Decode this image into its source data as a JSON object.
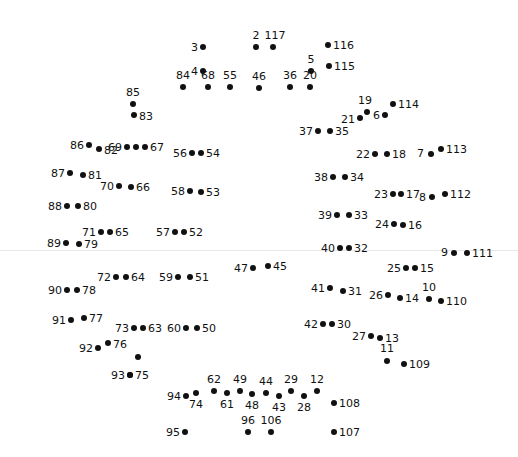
{
  "figure": {
    "kind": "connect-the-dots-puzzle",
    "title": "",
    "width": 518,
    "height": 457,
    "background_color": "#ffffff",
    "dot_color": "#111111",
    "label_color": "#111111",
    "fold_line_color": "#e8e8e8",
    "fold_line_y": 250,
    "total_points": 117
  },
  "points": [
    {
      "n": "3",
      "x": 203,
      "y": 47,
      "pos": "l",
      "lx": 198,
      "ly": 47
    },
    {
      "n": "2",
      "x": 256,
      "y": 47,
      "pos": "t",
      "lx": 256,
      "ly": 41
    },
    {
      "n": "117",
      "x": 273,
      "y": 47,
      "pos": "t",
      "lx": 275,
      "ly": 41
    },
    {
      "n": "116",
      "x": 328,
      "y": 45,
      "pos": "r",
      "lx": 333,
      "ly": 45
    },
    {
      "n": "115",
      "x": 329,
      "y": 66,
      "pos": "r",
      "lx": 334,
      "ly": 66
    },
    {
      "n": "5",
      "x": 311,
      "y": 71,
      "pos": "t",
      "lx": 311,
      "ly": 65
    },
    {
      "n": "4",
      "x": 203,
      "y": 71,
      "pos": "l",
      "lx": 198,
      "ly": 71
    },
    {
      "n": "84",
      "x": 183,
      "y": 87,
      "pos": "t",
      "lx": 183,
      "ly": 81
    },
    {
      "n": "68",
      "x": 208,
      "y": 87,
      "pos": "t",
      "lx": 208,
      "ly": 81
    },
    {
      "n": "55",
      "x": 230,
      "y": 87,
      "pos": "t",
      "lx": 230,
      "ly": 81
    },
    {
      "n": "46",
      "x": 259,
      "y": 88,
      "pos": "t",
      "lx": 259,
      "ly": 82
    },
    {
      "n": "36",
      "x": 290,
      "y": 87,
      "pos": "t",
      "lx": 290,
      "ly": 81
    },
    {
      "n": "20",
      "x": 310,
      "y": 87,
      "pos": "t",
      "lx": 310,
      "ly": 81
    },
    {
      "n": "85",
      "x": 133,
      "y": 104,
      "pos": "t",
      "lx": 133,
      "ly": 98
    },
    {
      "n": "83",
      "x": 134,
      "y": 115,
      "pos": "r",
      "lx": 139,
      "ly": 116
    },
    {
      "n": "114",
      "x": 393,
      "y": 104,
      "pos": "r",
      "lx": 398,
      "ly": 104
    },
    {
      "n": "19",
      "x": 367,
      "y": 112,
      "pos": "t",
      "lx": 365,
      "ly": 106
    },
    {
      "n": "6",
      "x": 385,
      "y": 115,
      "pos": "l",
      "lx": 380,
      "ly": 115
    },
    {
      "n": "21",
      "x": 360,
      "y": 118,
      "pos": "l",
      "lx": 355,
      "ly": 119
    },
    {
      "n": "37",
      "x": 318,
      "y": 131,
      "pos": "l",
      "lx": 313,
      "ly": 131
    },
    {
      "n": "35",
      "x": 330,
      "y": 131,
      "pos": "r",
      "lx": 335,
      "ly": 131
    },
    {
      "n": "86",
      "x": 89,
      "y": 145,
      "pos": "l",
      "lx": 84,
      "ly": 145
    },
    {
      "n": "82",
      "x": 99,
      "y": 149,
      "pos": "r",
      "lx": 104,
      "ly": 150
    },
    {
      "n": "69",
      "x": 127,
      "y": 147,
      "pos": "l",
      "lx": 122,
      "ly": 147
    },
    {
      "n": "67",
      "x": 145,
      "y": 147,
      "pos": "r",
      "lx": 150,
      "ly": 147
    },
    {
      "n": "69b",
      "x": 136,
      "y": 147,
      "pos": "none",
      "lx": 0,
      "ly": 0
    },
    {
      "n": "56",
      "x": 192,
      "y": 153,
      "pos": "l",
      "lx": 187,
      "ly": 153
    },
    {
      "n": "54",
      "x": 201,
      "y": 153,
      "pos": "r",
      "lx": 206,
      "ly": 153
    },
    {
      "n": "7",
      "x": 431,
      "y": 154,
      "pos": "l",
      "lx": 424,
      "ly": 153
    },
    {
      "n": "113",
      "x": 441,
      "y": 149,
      "pos": "r",
      "lx": 446,
      "ly": 149
    },
    {
      "n": "22",
      "x": 375,
      "y": 154,
      "pos": "l",
      "lx": 370,
      "ly": 154
    },
    {
      "n": "18",
      "x": 387,
      "y": 154,
      "pos": "r",
      "lx": 392,
      "ly": 154
    },
    {
      "n": "87",
      "x": 70,
      "y": 173,
      "pos": "l",
      "lx": 65,
      "ly": 173
    },
    {
      "n": "81",
      "x": 83,
      "y": 175,
      "pos": "r",
      "lx": 88,
      "ly": 175
    },
    {
      "n": "70",
      "x": 119,
      "y": 186,
      "pos": "l",
      "lx": 114,
      "ly": 186
    },
    {
      "n": "66",
      "x": 131,
      "y": 187,
      "pos": "r",
      "lx": 136,
      "ly": 187
    },
    {
      "n": "58",
      "x": 190,
      "y": 191,
      "pos": "l",
      "lx": 185,
      "ly": 191
    },
    {
      "n": "53",
      "x": 201,
      "y": 192,
      "pos": "r",
      "lx": 206,
      "ly": 192
    },
    {
      "n": "38",
      "x": 333,
      "y": 177,
      "pos": "l",
      "lx": 328,
      "ly": 177
    },
    {
      "n": "34",
      "x": 345,
      "y": 177,
      "pos": "r",
      "lx": 350,
      "ly": 177
    },
    {
      "n": "23",
      "x": 393,
      "y": 194,
      "pos": "l",
      "lx": 388,
      "ly": 194
    },
    {
      "n": "17",
      "x": 401,
      "y": 194,
      "pos": "r",
      "lx": 406,
      "ly": 194
    },
    {
      "n": "8",
      "x": 432,
      "y": 197,
      "pos": "l",
      "lx": 426,
      "ly": 197
    },
    {
      "n": "112",
      "x": 445,
      "y": 194,
      "pos": "r",
      "lx": 450,
      "ly": 194
    },
    {
      "n": "88",
      "x": 67,
      "y": 206,
      "pos": "l",
      "lx": 62,
      "ly": 206
    },
    {
      "n": "80",
      "x": 78,
      "y": 206,
      "pos": "r",
      "lx": 83,
      "ly": 206
    },
    {
      "n": "39",
      "x": 337,
      "y": 215,
      "pos": "l",
      "lx": 332,
      "ly": 215
    },
    {
      "n": "33",
      "x": 349,
      "y": 215,
      "pos": "r",
      "lx": 354,
      "ly": 215
    },
    {
      "n": "24",
      "x": 394,
      "y": 224,
      "pos": "l",
      "lx": 389,
      "ly": 224
    },
    {
      "n": "16",
      "x": 403,
      "y": 225,
      "pos": "r",
      "lx": 408,
      "ly": 225
    },
    {
      "n": "71",
      "x": 101,
      "y": 232,
      "pos": "l",
      "lx": 96,
      "ly": 232
    },
    {
      "n": "65",
      "x": 110,
      "y": 232,
      "pos": "r",
      "lx": 115,
      "ly": 232
    },
    {
      "n": "57",
      "x": 175,
      "y": 232,
      "pos": "l",
      "lx": 170,
      "ly": 232
    },
    {
      "n": "52",
      "x": 184,
      "y": 232,
      "pos": "r",
      "lx": 189,
      "ly": 232
    },
    {
      "n": "89",
      "x": 66,
      "y": 243,
      "pos": "l",
      "lx": 61,
      "ly": 243
    },
    {
      "n": "79",
      "x": 79,
      "y": 244,
      "pos": "r",
      "lx": 84,
      "ly": 244
    },
    {
      "n": "40",
      "x": 340,
      "y": 248,
      "pos": "l",
      "lx": 335,
      "ly": 248
    },
    {
      "n": "32",
      "x": 349,
      "y": 248,
      "pos": "r",
      "lx": 354,
      "ly": 248
    },
    {
      "n": "9",
      "x": 454,
      "y": 253,
      "pos": "l",
      "lx": 448,
      "ly": 252
    },
    {
      "n": "111",
      "x": 467,
      "y": 253,
      "pos": "r",
      "lx": 472,
      "ly": 253
    },
    {
      "n": "47",
      "x": 253,
      "y": 268,
      "pos": "l",
      "lx": 248,
      "ly": 268
    },
    {
      "n": "45",
      "x": 268,
      "y": 266,
      "pos": "r",
      "lx": 273,
      "ly": 266
    },
    {
      "n": "72",
      "x": 116,
      "y": 277,
      "pos": "l",
      "lx": 111,
      "ly": 277
    },
    {
      "n": "64",
      "x": 126,
      "y": 277,
      "pos": "r",
      "lx": 131,
      "ly": 277
    },
    {
      "n": "59",
      "x": 178,
      "y": 277,
      "pos": "l",
      "lx": 173,
      "ly": 277
    },
    {
      "n": "51",
      "x": 190,
      "y": 277,
      "pos": "r",
      "lx": 195,
      "ly": 277
    },
    {
      "n": "25",
      "x": 406,
      "y": 268,
      "pos": "l",
      "lx": 401,
      "ly": 268
    },
    {
      "n": "15",
      "x": 415,
      "y": 268,
      "pos": "r",
      "lx": 420,
      "ly": 268
    },
    {
      "n": "90",
      "x": 67,
      "y": 290,
      "pos": "l",
      "lx": 62,
      "ly": 290
    },
    {
      "n": "78",
      "x": 77,
      "y": 290,
      "pos": "r",
      "lx": 82,
      "ly": 290
    },
    {
      "n": "41",
      "x": 330,
      "y": 288,
      "pos": "l",
      "lx": 325,
      "ly": 288
    },
    {
      "n": "31",
      "x": 343,
      "y": 291,
      "pos": "r",
      "lx": 348,
      "ly": 291
    },
    {
      "n": "26",
      "x": 388,
      "y": 295,
      "pos": "l",
      "lx": 383,
      "ly": 295
    },
    {
      "n": "14",
      "x": 400,
      "y": 298,
      "pos": "r",
      "lx": 405,
      "ly": 298
    },
    {
      "n": "10",
      "x": 429,
      "y": 299,
      "pos": "t",
      "lx": 429,
      "ly": 293
    },
    {
      "n": "110",
      "x": 441,
      "y": 301,
      "pos": "r",
      "lx": 446,
      "ly": 301
    },
    {
      "n": "91",
      "x": 71,
      "y": 320,
      "pos": "l",
      "lx": 66,
      "ly": 320
    },
    {
      "n": "77",
      "x": 84,
      "y": 318,
      "pos": "r",
      "lx": 89,
      "ly": 318
    },
    {
      "n": "73",
      "x": 134,
      "y": 328,
      "pos": "l",
      "lx": 129,
      "ly": 328
    },
    {
      "n": "63",
      "x": 143,
      "y": 328,
      "pos": "r",
      "lx": 148,
      "ly": 328
    },
    {
      "n": "60",
      "x": 186,
      "y": 328,
      "pos": "l",
      "lx": 181,
      "ly": 328
    },
    {
      "n": "50",
      "x": 197,
      "y": 328,
      "pos": "r",
      "lx": 202,
      "ly": 328
    },
    {
      "n": "42",
      "x": 323,
      "y": 324,
      "pos": "l",
      "lx": 318,
      "ly": 324
    },
    {
      "n": "30",
      "x": 332,
      "y": 324,
      "pos": "r",
      "lx": 337,
      "ly": 324
    },
    {
      "n": "27",
      "x": 371,
      "y": 336,
      "pos": "l",
      "lx": 366,
      "ly": 336
    },
    {
      "n": "13",
      "x": 380,
      "y": 338,
      "pos": "r",
      "lx": 385,
      "ly": 338
    },
    {
      "n": "76",
      "x": 108,
      "y": 343,
      "pos": "r",
      "lx": 113,
      "ly": 344
    },
    {
      "n": "92",
      "x": 98,
      "y": 348,
      "pos": "l",
      "lx": 93,
      "ly": 348
    },
    {
      "n": "11",
      "x": 387,
      "y": 361,
      "pos": "t",
      "lx": 387,
      "ly": 354
    },
    {
      "n": "109",
      "x": 404,
      "y": 364,
      "pos": "r",
      "lx": 409,
      "ly": 364
    },
    {
      "n": "75",
      "x": 138,
      "y": 357,
      "pos": "none",
      "lx": 0,
      "ly": 0
    },
    {
      "n": "93",
      "x": 130,
      "y": 375,
      "pos": "l",
      "lx": 125,
      "ly": 375
    },
    {
      "n": "75b",
      "x": 130,
      "y": 375,
      "pos": "r",
      "lx": 135,
      "ly": 375
    },
    {
      "n": "94",
      "x": 186,
      "y": 396,
      "pos": "l",
      "lx": 181,
      "ly": 396
    },
    {
      "n": "74",
      "x": 196,
      "y": 393,
      "pos": "b",
      "lx": 196,
      "ly": 399
    },
    {
      "n": "62",
      "x": 214,
      "y": 391,
      "pos": "t",
      "lx": 214,
      "ly": 385
    },
    {
      "n": "61",
      "x": 227,
      "y": 393,
      "pos": "b",
      "lx": 227,
      "ly": 399
    },
    {
      "n": "49",
      "x": 240,
      "y": 391,
      "pos": "t",
      "lx": 240,
      "ly": 385
    },
    {
      "n": "48",
      "x": 252,
      "y": 394,
      "pos": "b",
      "lx": 252,
      "ly": 400
    },
    {
      "n": "44",
      "x": 266,
      "y": 393,
      "pos": "t",
      "lx": 266,
      "ly": 387
    },
    {
      "n": "43",
      "x": 279,
      "y": 396,
      "pos": "b",
      "lx": 279,
      "ly": 402
    },
    {
      "n": "29",
      "x": 291,
      "y": 391,
      "pos": "t",
      "lx": 291,
      "ly": 385
    },
    {
      "n": "28",
      "x": 304,
      "y": 396,
      "pos": "b",
      "lx": 304,
      "ly": 402
    },
    {
      "n": "12",
      "x": 317,
      "y": 391,
      "pos": "t",
      "lx": 317,
      "ly": 385
    },
    {
      "n": "108",
      "x": 334,
      "y": 403,
      "pos": "r",
      "lx": 339,
      "ly": 403
    },
    {
      "n": "95",
      "x": 185,
      "y": 432,
      "pos": "l",
      "lx": 180,
      "ly": 432
    },
    {
      "n": "96",
      "x": 248,
      "y": 432,
      "pos": "t",
      "lx": 248,
      "ly": 426
    },
    {
      "n": "106",
      "x": 271,
      "y": 432,
      "pos": "t",
      "lx": 271,
      "ly": 426
    },
    {
      "n": "107",
      "x": 334,
      "y": 432,
      "pos": "r",
      "lx": 339,
      "ly": 432
    }
  ]
}
